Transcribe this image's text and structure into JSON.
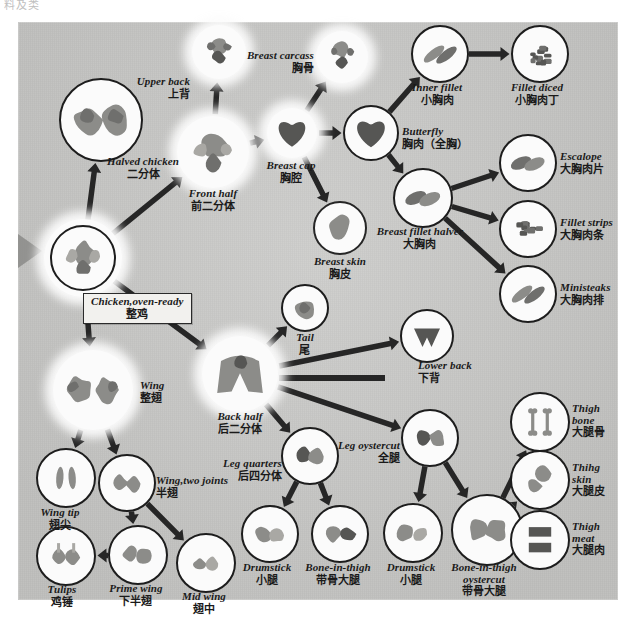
{
  "top_fragment": "料及类",
  "diagram": {
    "title_en": "Chicken cutting / deboning flow chart",
    "background_color": "#c9c9c7",
    "line_color": "#262626"
  },
  "nodes": [
    {
      "id": "chicken_oven_ready",
      "en": "Chicken,oven-ready",
      "zh": "整鸡",
      "x": 83,
      "y": 258,
      "r": 31,
      "style": "double",
      "cap": "boxed",
      "cap_x": 83,
      "cap_y": 293
    },
    {
      "id": "halved_chicken",
      "en": "Halved chicken",
      "zh": "二分体",
      "x": 101,
      "y": 120,
      "r": 40,
      "style": "outlined",
      "cap": "below",
      "cap_x": 143,
      "cap_y": 156
    },
    {
      "id": "front_half",
      "en": "Front half",
      "zh": "前二分体",
      "x": 213,
      "y": 152,
      "r": 36,
      "style": "glow",
      "cap": "below",
      "cap_x": 213,
      "cap_y": 188
    },
    {
      "id": "upper_back",
      "en": "Upper back",
      "zh": "上背",
      "x": 219,
      "y": 52,
      "r": 27,
      "style": "glow",
      "cap": "left",
      "cap_x": 190,
      "cap_y": 88
    },
    {
      "id": "breast_cap",
      "en": "Breast cap",
      "zh": "胸腔",
      "x": 292,
      "y": 133,
      "r": 25,
      "style": "glow",
      "cap": "below",
      "cap_x": 291,
      "cap_y": 160
    },
    {
      "id": "breast_carcass",
      "en": "Breast carcass",
      "zh": "胸骨",
      "x": 342,
      "y": 57,
      "r": 26,
      "style": "glow",
      "cap": "left",
      "cap_x": 314,
      "cap_y": 62
    },
    {
      "id": "breast_skin",
      "en": "Breast skin",
      "zh": "胸皮",
      "x": 340,
      "y": 228,
      "r": 25,
      "style": "thin",
      "cap": "below",
      "cap_x": 340,
      "cap_y": 256
    },
    {
      "id": "butterfly",
      "en": "Butterfly",
      "zh": "胸肉（全胸）",
      "x": 371,
      "y": 133,
      "r": 26,
      "style": "outlined",
      "cap": "right",
      "cap_x": 402,
      "cap_y": 138
    },
    {
      "id": "inner_fillet",
      "en": "Inner fillet",
      "zh": "小胸肉",
      "x": 440,
      "y": 54,
      "r": 27,
      "style": "outlined",
      "cap": "below",
      "cap_x": 437,
      "cap_y": 82
    },
    {
      "id": "fillet_diced",
      "en": "Fillet diced",
      "zh": "小胸肉丁",
      "x": 540,
      "y": 54,
      "r": 27,
      "style": "outlined",
      "cap": "below",
      "cap_x": 537,
      "cap_y": 82
    },
    {
      "id": "breast_fillet_halver",
      "en": "Breast fillet halver",
      "zh": "大胸肉",
      "x": 423,
      "y": 198,
      "r": 28,
      "style": "outlined",
      "cap": "below",
      "cap_x": 420,
      "cap_y": 226
    },
    {
      "id": "escalope",
      "en": "Escalope",
      "zh": "大胸肉片",
      "x": 528,
      "y": 163,
      "r": 27,
      "style": "outlined",
      "cap": "right",
      "cap_x": 560,
      "cap_y": 163
    },
    {
      "id": "fillet_strips",
      "en": "Fillet strips",
      "zh": "大胸肉条",
      "x": 528,
      "y": 229,
      "r": 27,
      "style": "outlined",
      "cap": "right",
      "cap_x": 560,
      "cap_y": 229
    },
    {
      "id": "ministeaks",
      "en": "Ministeaks",
      "zh": "大胸肉排",
      "x": 528,
      "y": 294,
      "r": 27,
      "style": "outlined",
      "cap": "right",
      "cap_x": 560,
      "cap_y": 294
    },
    {
      "id": "wing",
      "en": "Wing",
      "zh": "整翅",
      "x": 93,
      "y": 390,
      "r": 40,
      "style": "glow",
      "cap": "right",
      "cap_x": 140,
      "cap_y": 392
    },
    {
      "id": "wing_tip",
      "en": "Wing tip",
      "zh": "翅尖",
      "x": 66,
      "y": 478,
      "r": 28,
      "style": "outlined",
      "cap": "below",
      "cap_x": 60,
      "cap_y": 507
    },
    {
      "id": "wing_two_joints",
      "en": "Wing,two joints",
      "zh": "半翅",
      "x": 127,
      "y": 483,
      "r": 27,
      "style": "outlined",
      "cap": "right",
      "cap_x": 156,
      "cap_y": 487
    },
    {
      "id": "tulips",
      "en": "Tulips",
      "zh": "鸡锤",
      "x": 66,
      "y": 556,
      "r": 28,
      "style": "outlined",
      "cap": "below",
      "cap_x": 62,
      "cap_y": 584
    },
    {
      "id": "prime_wing",
      "en": "Prime wing",
      "zh": "下半翅",
      "x": 138,
      "y": 555,
      "r": 28,
      "style": "outlined",
      "cap": "below",
      "cap_x": 136,
      "cap_y": 583
    },
    {
      "id": "mid_wing",
      "en": "Mid wing",
      "zh": "翅中",
      "x": 206,
      "y": 563,
      "r": 28,
      "style": "outlined",
      "cap": "below",
      "cap_x": 204,
      "cap_y": 591
    },
    {
      "id": "back_half",
      "en": "Back half",
      "zh": "后二分体",
      "x": 240,
      "y": 374,
      "r": 38,
      "style": "glow",
      "cap": "below",
      "cap_x": 240,
      "cap_y": 411
    },
    {
      "id": "tail",
      "en": "Tail",
      "zh": "尾",
      "x": 305,
      "y": 308,
      "r": 22,
      "style": "outlined",
      "cap": "below",
      "cap_x": 305,
      "cap_y": 332
    },
    {
      "id": "lower_back",
      "en": "Lower back",
      "zh": "下背",
      "x": 427,
      "y": 336,
      "r": 25,
      "style": "outlined",
      "cap": "right",
      "cap_x": 418,
      "cap_y": 372
    },
    {
      "id": "leg_quarters",
      "en": "Leg quarters",
      "zh": "后四分体",
      "x": 310,
      "y": 456,
      "r": 27,
      "style": "outlined",
      "cap": "left",
      "cap_x": 282,
      "cap_y": 470
    },
    {
      "id": "drumstick_left",
      "en": "Drumstick",
      "zh": "小腿",
      "x": 270,
      "y": 534,
      "r": 27,
      "style": "outlined",
      "cap": "below",
      "cap_x": 267,
      "cap_y": 562
    },
    {
      "id": "bone_in_thigh",
      "en": "Bone-in-thigh",
      "zh": "带骨大腿",
      "x": 340,
      "y": 534,
      "r": 27,
      "style": "outlined",
      "cap": "below",
      "cap_x": 338,
      "cap_y": 562
    },
    {
      "id": "leg_oystercut",
      "en": "Leg oystercut",
      "zh": "全腿",
      "x": 430,
      "y": 438,
      "r": 27,
      "style": "outlined",
      "cap": "left",
      "cap_x": 400,
      "cap_y": 452
    },
    {
      "id": "drumstick_right",
      "en": "Drumstick",
      "zh": "小腿",
      "x": 413,
      "y": 533,
      "r": 28,
      "style": "outlined",
      "cap": "below",
      "cap_x": 411,
      "cap_y": 562
    },
    {
      "id": "bone_in_thigh_oystercut",
      "en": "Bone-in-thigh",
      "en2": "oystercut",
      "zh": "带骨大腿",
      "x": 487,
      "y": 530,
      "r": 34,
      "style": "outlined",
      "cap": "below",
      "cap_x": 484,
      "cap_y": 562
    },
    {
      "id": "thigh_bone",
      "en": "Thigh",
      "en2": "bone",
      "zh": "大腿骨",
      "x": 540,
      "y": 422,
      "r": 28,
      "style": "outlined",
      "cap": "right",
      "cap_x": 572,
      "cap_y": 421
    },
    {
      "id": "thigh_skin",
      "en": "Thihg",
      "en2": "skin",
      "zh": "大腿皮",
      "x": 540,
      "y": 480,
      "r": 28,
      "style": "outlined",
      "cap": "right",
      "cap_x": 572,
      "cap_y": 480
    },
    {
      "id": "thigh_meat",
      "en": "Thigh",
      "en2": "meat",
      "zh": "大腿肉",
      "x": 540,
      "y": 540,
      "r": 28,
      "style": "outlined",
      "cap": "right",
      "cap_x": 572,
      "cap_y": 539
    }
  ],
  "edges": [
    {
      "from": "chicken_oven_ready",
      "to": "halved_chicken"
    },
    {
      "from": "chicken_oven_ready",
      "to": "front_half"
    },
    {
      "from": "chicken_oven_ready",
      "to": "wing"
    },
    {
      "from": "chicken_oven_ready",
      "to": "back_half"
    },
    {
      "from": "front_half",
      "to": "upper_back"
    },
    {
      "from": "front_half",
      "to": "breast_cap"
    },
    {
      "from": "breast_cap",
      "to": "breast_carcass"
    },
    {
      "from": "breast_cap",
      "to": "butterfly"
    },
    {
      "from": "breast_cap",
      "to": "breast_skin"
    },
    {
      "from": "butterfly",
      "to": "inner_fillet"
    },
    {
      "from": "butterfly",
      "to": "breast_fillet_halver"
    },
    {
      "from": "inner_fillet",
      "to": "fillet_diced"
    },
    {
      "from": "breast_fillet_halver",
      "to": "escalope"
    },
    {
      "from": "breast_fillet_halver",
      "to": "fillet_strips"
    },
    {
      "from": "breast_fillet_halver",
      "to": "ministeaks"
    },
    {
      "from": "wing",
      "to": "wing_tip"
    },
    {
      "from": "wing",
      "to": "wing_two_joints"
    },
    {
      "from": "wing_two_joints",
      "to": "prime_wing"
    },
    {
      "from": "wing_two_joints",
      "to": "mid_wing"
    },
    {
      "from": "prime_wing",
      "to": "tulips"
    },
    {
      "from": "back_half",
      "to": "tail"
    },
    {
      "from": "back_half",
      "to": "lower_back"
    },
    {
      "from": "back_half",
      "to": "leg_oystercut"
    },
    {
      "from": "back_half",
      "to": "leg_quarters"
    },
    {
      "from": "leg_quarters",
      "to": "drumstick_left"
    },
    {
      "from": "leg_quarters",
      "to": "bone_in_thigh"
    },
    {
      "from": "leg_oystercut",
      "to": "drumstick_right"
    },
    {
      "from": "leg_oystercut",
      "to": "bone_in_thigh_oystercut"
    },
    {
      "from": "bone_in_thigh_oystercut",
      "to": "thigh_bone"
    },
    {
      "from": "bone_in_thigh_oystercut",
      "to": "thigh_skin"
    },
    {
      "from": "bone_in_thigh_oystercut",
      "to": "thigh_meat"
    }
  ]
}
